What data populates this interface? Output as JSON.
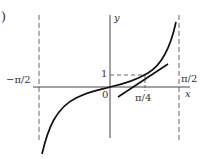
{
  "figure": {
    "panel_mark": ")",
    "axes": {
      "x_label": "x",
      "y_label": "y",
      "origin_label": "0"
    },
    "ticks": {
      "left_asymptote": "−π/2",
      "right_asymptote": "π/2",
      "quarter_pi": "π/4",
      "one": "1"
    },
    "curves": [
      {
        "name": "y = tan x",
        "style": "solid"
      },
      {
        "name": "tangent line at (π/4, 1)",
        "style": "solid"
      }
    ],
    "guides": [
      {
        "name": "x = −π/2",
        "style": "dashed"
      },
      {
        "name": "x = π/2",
        "style": "dashed"
      },
      {
        "name": "y = 1 to x = π/4",
        "style": "dashed"
      }
    ],
    "colors": {
      "curve": "#111111",
      "axis": "#444444",
      "dashed": "#666666",
      "text": "#333333"
    }
  }
}
